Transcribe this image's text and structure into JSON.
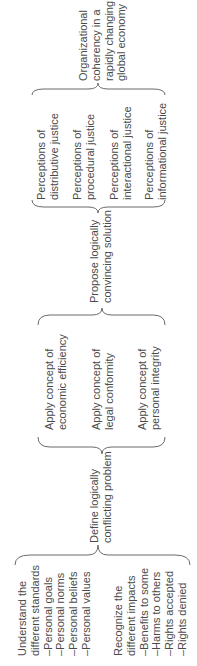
{
  "diagram": {
    "orientation": "rotated-90-ccw",
    "stage1": {
      "standards": {
        "heading": [
          "Understand the",
          "different standards"
        ],
        "items": [
          "–Personal goals",
          "–Personal norms",
          "–Personal beliefs",
          "–Personal values"
        ]
      },
      "impacts": {
        "heading": [
          "Recognize the",
          "different impacts"
        ],
        "items": [
          "–Benefits to some",
          "–Harms to others",
          "–Rights accepted",
          "–Rights denied"
        ]
      }
    },
    "step1": [
      "Define logically",
      "conflicting problem"
    ],
    "stage2": [
      [
        "Apply concept of",
        "economic efficiency"
      ],
      [
        "Apply concept of",
        "legal conformity"
      ],
      [
        "Apply concept of",
        "personal integrity"
      ]
    ],
    "step2": [
      "Propose logically",
      "convincing solution"
    ],
    "stage3": [
      [
        "Perceptions of",
        "distributive justice"
      ],
      [
        "Perceptions of",
        "procedural justice"
      ],
      [
        "Perceptions of",
        "interactional justice"
      ],
      [
        "Perceptions of",
        "informational justice"
      ]
    ],
    "outcome": [
      "Organizational",
      "coherency in a",
      "rapidly changing",
      "global economy"
    ],
    "colors": {
      "text": "#4a4a4a",
      "brace": "#6a6a6a",
      "background": "#ffffff"
    }
  }
}
